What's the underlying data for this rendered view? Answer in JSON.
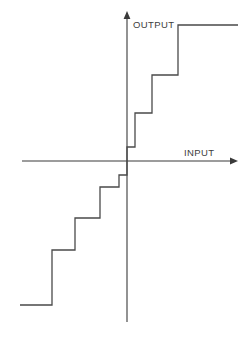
{
  "figure": {
    "width": 250,
    "height": 338,
    "background_color": "#ffffff",
    "line_color": "#4a4a4a",
    "axis_color": "#3a3a3a",
    "text_color": "#3d3d3d"
  },
  "labels": {
    "output": "OUTPUT",
    "input": "INPUT"
  },
  "chart_data": {
    "type": "line",
    "title": "",
    "subtitle": "",
    "xlabel": "INPUT",
    "ylabel": "OUTPUT",
    "grid": false,
    "legend": null,
    "axes": {
      "x_axis": {
        "label": "INPUT",
        "label_position": "above-right-end",
        "pixel_y": 161,
        "pixel_x_start": 22,
        "pixel_x_end": 238,
        "arrow": "right"
      },
      "y_axis": {
        "label": "OUTPUT",
        "label_position": "right-of-top",
        "pixel_x": 127,
        "pixel_y_top": 11,
        "pixel_y_bottom": 322,
        "arrow": "up"
      },
      "origin": {
        "x": 127,
        "y": 161
      },
      "xlim": [
        -5.5,
        5.5
      ],
      "ylim": [
        -5.0,
        5.0
      ]
    },
    "quantizer": {
      "step_width_units": 1,
      "step_height_units": 1,
      "visible_positive_steps": 4,
      "visible_negative_steps": 4,
      "symmetry": "odd"
    },
    "x": [
      -5.5,
      -4.2,
      -4.2,
      -3.2,
      -3.2,
      -2.1,
      -2.1,
      -1.1,
      -1.1,
      -0.25,
      -0.25,
      0.25,
      0.25,
      1.1,
      1.1,
      2.1,
      2.1,
      3.2,
      3.2,
      4.2,
      4.2,
      5.5
    ],
    "y": [
      -4.5,
      -4.5,
      -3.3,
      -3.3,
      -2.2,
      -2.2,
      -1.2,
      -1.2,
      -0.45,
      -0.45,
      0,
      0,
      0.45,
      0.45,
      1.2,
      1.2,
      2.2,
      2.2,
      3.3,
      3.3,
      4.5,
      4.5
    ],
    "polyline_pixels": "20,305 52,305 52,250 75,250 75,218 100,218 100,187 119,187 119,175 127,175 127,161 127,147 135,147 135,113 152,113 152,75 178,75 178,25 210,25 238,25",
    "treads_pixels": [
      {
        "y": 305,
        "x_start": 20,
        "x_end": 52
      },
      {
        "y": 250,
        "x_start": 52,
        "x_end": 75
      },
      {
        "y": 218,
        "x_start": 75,
        "x_end": 100
      },
      {
        "y": 187,
        "x_start": 100,
        "x_end": 119
      },
      {
        "y": 175,
        "x_start": 119,
        "x_end": 127
      },
      {
        "y": 147,
        "x_start": 127,
        "x_end": 135
      },
      {
        "y": 113,
        "x_start": 135,
        "x_end": 152
      },
      {
        "y": 75,
        "x_start": 152,
        "x_end": 178
      },
      {
        "y": 25,
        "x_start": 178,
        "x_end": 238
      }
    ]
  }
}
